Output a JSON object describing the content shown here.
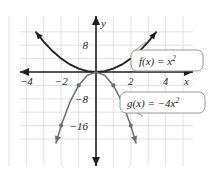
{
  "chart_data": {
    "type": "line",
    "title": "",
    "xlabel": "x",
    "ylabel": "y",
    "xlim": [
      -5.3,
      5.0
    ],
    "ylim": [
      -21.5,
      13.0
    ],
    "grid": true,
    "grid_step_x": 1,
    "grid_step_y": 4,
    "legend": "callouts",
    "x_ticks": [
      -4,
      -2,
      2,
      4
    ],
    "x_tick_labels": [
      "−4",
      "−2",
      "2",
      "4"
    ],
    "y_ticks": [
      8,
      -8,
      -16
    ],
    "y_tick_labels": [
      "8",
      "−8",
      "−16"
    ],
    "series": [
      {
        "name": "f",
        "equation": "f(x) = x²",
        "color": "#231f20",
        "x": [
          -3.45,
          -3.0,
          -2.5,
          -2.0,
          -1.5,
          -1.0,
          -0.5,
          0.0,
          0.5,
          1.0,
          1.5,
          2.0,
          2.5,
          3.0,
          3.45
        ],
        "values": [
          11.9,
          9.0,
          6.25,
          4.0,
          2.25,
          1.0,
          0.25,
          0.0,
          0.25,
          1.0,
          2.25,
          4.0,
          6.25,
          9.0,
          11.9
        ],
        "arrows": "both",
        "points": []
      },
      {
        "name": "g",
        "equation": "g(x) = −4x²",
        "color": "#6d6e71",
        "x": [
          -2.3,
          -2.0,
          -1.5,
          -1.0,
          -0.5,
          0.0,
          0.5,
          1.0,
          1.5,
          2.0,
          2.3
        ],
        "values": [
          -21.2,
          -16.0,
          -9.0,
          -4.0,
          -1.0,
          0.0,
          -1.0,
          -4.0,
          -9.0,
          -16.0,
          -21.2
        ],
        "arrows": "both",
        "points": [
          {
            "x": -2,
            "y": -16
          },
          {
            "x": -1,
            "y": -4
          },
          {
            "x": 1,
            "y": -4
          },
          {
            "x": 2,
            "y": -16
          }
        ]
      }
    ]
  },
  "callouts": {
    "f": {
      "fn": "f(x)",
      "eq_lead": " = x",
      "eq_exp": "2",
      "full": "f(x) = x²"
    },
    "g": {
      "fn": "g(x)",
      "eq_lead": " = −4x",
      "eq_exp": "2",
      "full": "g(x) = −4x²"
    }
  },
  "axes": {
    "x_axis_name": "x",
    "y_axis_name": "y"
  },
  "colors": {
    "grid": "#d9dadb",
    "axis": "#231f20",
    "curve_f": "#231f20",
    "curve_g": "#6d6e71",
    "callout_border": "#8c8c8c",
    "background": "#ffffff"
  }
}
